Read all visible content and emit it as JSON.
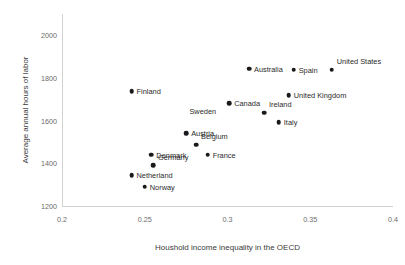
{
  "chart_data": {
    "type": "scatter",
    "title": "",
    "xlabel": "Houshold income inequality in the OECD",
    "ylabel": "Average annual hours of labor",
    "xlim": [
      0.2,
      0.4
    ],
    "ylim": [
      1200,
      2100
    ],
    "xticks": [
      "0.2",
      "0.25",
      "0.3",
      "0.35",
      "0.4"
    ],
    "xtick_values": [
      0.2,
      0.25,
      0.3,
      0.35,
      0.4
    ],
    "yticks": [
      "1200",
      "1400",
      "1600",
      "1800",
      "2000"
    ],
    "ytick_values": [
      1200,
      1400,
      1600,
      1800,
      2000
    ],
    "grid": false,
    "legend": null,
    "marker_color": "#1a1a1a",
    "points": [
      {
        "label": "Australia",
        "x": 0.313,
        "y": 1843,
        "label_side": "right"
      },
      {
        "label": "Spain",
        "x": 0.34,
        "y": 1838,
        "label_side": "right"
      },
      {
        "label": "United States",
        "x": 0.363,
        "y": 1838,
        "label_side": "right",
        "label_dy": -9
      },
      {
        "label": "Finland",
        "x": 0.242,
        "y": 1738,
        "label_side": "right"
      },
      {
        "label": "United Kingdom",
        "x": 0.337,
        "y": 1720,
        "label_side": "right"
      },
      {
        "label": "Canada",
        "x": 0.301,
        "y": 1682,
        "label_side": "right"
      },
      {
        "label": "Ireland",
        "x": 0.322,
        "y": 1638,
        "label_side": "right",
        "label_dy": -9
      },
      {
        "label": "Italy",
        "x": 0.331,
        "y": 1592,
        "label_side": "right"
      },
      {
        "label": "Austria",
        "x": 0.275,
        "y": 1540,
        "label_side": "right"
      },
      {
        "label": "Belgium",
        "x": 0.281,
        "y": 1488,
        "label_side": "right",
        "label_dy": -9
      },
      {
        "label": "Denmark",
        "x": 0.254,
        "y": 1440,
        "label_side": "right"
      },
      {
        "label": "France",
        "x": 0.288,
        "y": 1440,
        "label_side": "right"
      },
      {
        "label": "Germany",
        "x": 0.255,
        "y": 1392,
        "label_side": "right",
        "label_dy": -8
      },
      {
        "label": "Netherland",
        "x": 0.242,
        "y": 1345,
        "label_side": "right"
      },
      {
        "label": "Norway",
        "x": 0.25,
        "y": 1290,
        "label_side": "right"
      }
    ],
    "unmarked_labels": [
      {
        "label": "Sweden",
        "x": 0.277,
        "y": 1643
      }
    ]
  }
}
